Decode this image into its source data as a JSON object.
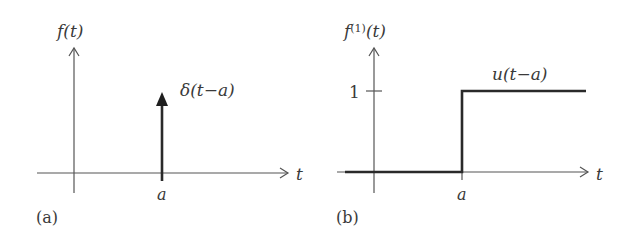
{
  "panels": [
    {
      "id": "a",
      "caption": "(a)",
      "y_axis_label": "f(t)",
      "x_axis_label": "t",
      "x_tick_label": "a",
      "curve_label": "δ(t−a)",
      "curve_type": "impulse"
    },
    {
      "id": "b",
      "caption": "(b)",
      "y_axis_label_base": "f",
      "y_axis_label_sup": "(1)",
      "y_axis_label_arg": "(t)",
      "x_axis_label": "t",
      "x_tick_label": "a",
      "y_tick_label": "1",
      "curve_label": "u(t−a)",
      "curve_type": "step"
    }
  ],
  "colors": {
    "axis": "#555555",
    "curve": "#2a2a2a",
    "text": "#3a3a3a"
  }
}
